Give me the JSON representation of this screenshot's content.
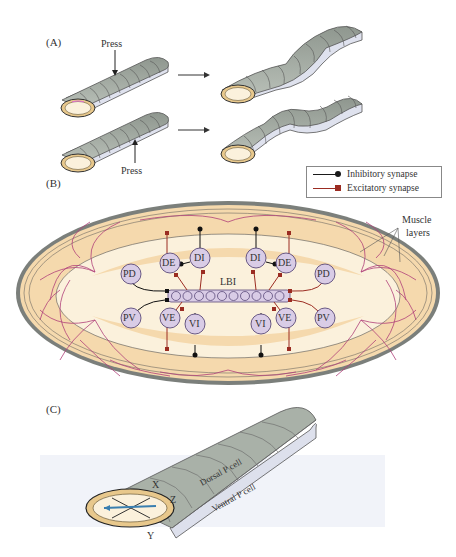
{
  "panels": {
    "a": {
      "label": "(A)",
      "press_top": "Press",
      "press_bottom": "Press"
    },
    "b": {
      "label": "(B)",
      "legend": {
        "inhibitory": "Inhibitory synapse",
        "excitatory": "Excitatory synapse",
        "inhibitory_color": "#1a1a1a",
        "excitatory_color": "#9b2c22"
      },
      "muscle_label_line1": "Muscle",
      "muscle_label_line2": "layers",
      "interneuron": "LBI",
      "interneuron_segments": 10,
      "neurons": {
        "left_de": "DE",
        "left_di": "DI",
        "left_pd": "PD",
        "left_pv": "PV",
        "left_ve": "VE",
        "left_vi": "VI",
        "right_de": "DE",
        "right_di": "DI",
        "right_pd": "PD",
        "right_pv": "PV",
        "right_ve": "VE",
        "right_vi": "VI"
      }
    },
    "c": {
      "label": "(C)",
      "dorsal": "Dorsal P cell",
      "ventral": "Ventral P cell",
      "axis_x": "X",
      "axis_y": "Y",
      "axis_z": "Z"
    }
  },
  "colors": {
    "body_gray": "#a9b1a8",
    "body_side": "#dde0ec",
    "tube_cream": "#fbf1dc",
    "tube_rim": "#e8c88c",
    "muscle_tan": "#f5d9ad",
    "nerve_pink": "#b0407a",
    "neuron_fill": "#d9cce6",
    "neuron_stroke": "#5a4a7a",
    "axis_blue": "#3a7fb0"
  }
}
